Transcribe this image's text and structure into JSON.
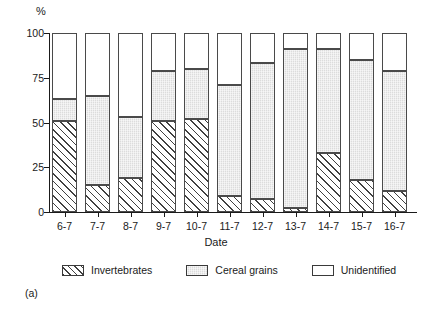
{
  "chart_data": {
    "type": "bar",
    "subtype": "stacked-percentage",
    "title": "",
    "xlabel": "Date",
    "ylabel": "%",
    "ylim": [
      0,
      100
    ],
    "yticks": [
      0,
      25,
      50,
      75,
      100
    ],
    "ytick_labels": [
      "0",
      "25",
      "50",
      "75",
      "100"
    ],
    "grid": false,
    "legend_position": "bottom",
    "stack_order": [
      "Invertebrates",
      "Cereal grains",
      "Unidentified"
    ],
    "categories": [
      "6-7",
      "7-7",
      "8-7",
      "9-7",
      "10-7",
      "11-7",
      "12-7",
      "13-7",
      "14-7",
      "15-7",
      "16-7"
    ],
    "series": [
      {
        "name": "Invertebrates",
        "fill": "diagonal-hatch",
        "color": "#ffffff",
        "values": [
          51,
          15,
          19,
          51,
          52,
          9,
          7,
          2,
          33,
          18,
          12
        ]
      },
      {
        "name": "Cereal grains",
        "fill": "light-stipple",
        "color": "#dcdcdc",
        "values": [
          12,
          50,
          34,
          28,
          28,
          62,
          76,
          89,
          58,
          67,
          67
        ]
      },
      {
        "name": "Unidentified",
        "fill": "solid-white",
        "color": "#ffffff",
        "values": [
          37,
          35,
          47,
          21,
          20,
          29,
          17,
          9,
          9,
          15,
          21
        ]
      }
    ],
    "cumulative_tops": {
      "invertebrates": [
        51,
        15,
        19,
        51,
        52,
        9,
        7,
        2,
        33,
        18,
        12
      ],
      "cereal_grains": [
        63,
        65,
        53,
        79,
        80,
        71,
        83,
        91,
        91,
        85,
        79
      ],
      "unidentified": [
        100,
        100,
        100,
        100,
        100,
        100,
        100,
        100,
        100,
        100,
        100
      ]
    }
  },
  "legend": {
    "items": [
      {
        "label": "Invertebrates",
        "swatch": "hatched-swatch"
      },
      {
        "label": "Cereal grains",
        "swatch": "gray-swatch"
      },
      {
        "label": "Unidentified",
        "swatch": "white-swatch"
      }
    ]
  },
  "panel": {
    "label": "(a)"
  },
  "colors": {
    "axis": "#1a1a1a",
    "bar_outline": "#4a4a4a",
    "cereal_fill": "#dcdcdc",
    "hatch_line": "#404040",
    "background": "#ffffff"
  }
}
